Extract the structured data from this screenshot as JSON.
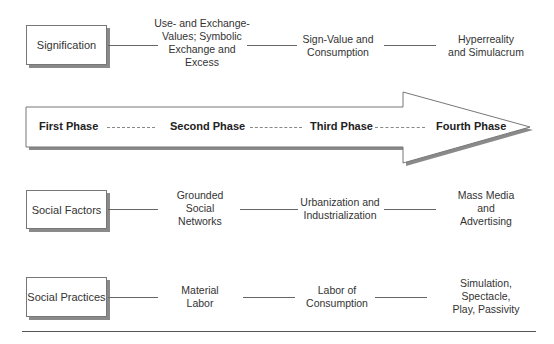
{
  "rows": [
    {
      "label": "Signification",
      "nodes": [
        "Use- and Exchange-\nValues; Symbolic\nExchange and\nExcess",
        "Sign-Value and\nConsumption",
        "Hyperreality\nand Simulacrum"
      ]
    },
    {
      "label": "Social Factors",
      "nodes": [
        "Grounded\nSocial\nNetworks",
        "Urbanization and\nIndustrialization",
        "Mass Media\nand\nAdvertising"
      ]
    },
    {
      "label": "Social Practices",
      "nodes": [
        "Material\nLabor",
        "Labor of\nConsumption",
        "Simulation,\nSpectacle,\nPlay, Passivity"
      ]
    }
  ],
  "arrow": {
    "phases": [
      "First Phase",
      "Second Phase",
      "Third Phase",
      "Fourth Phase"
    ]
  },
  "colors": {
    "stroke": "#777777",
    "shadow": "#8a8a8a",
    "text": "#333333"
  }
}
